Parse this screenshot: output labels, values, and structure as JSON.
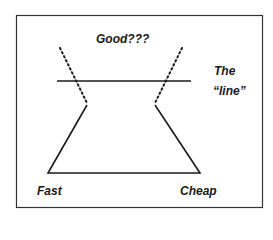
{
  "diagram": {
    "title": "",
    "labels": {
      "top": "Good???",
      "line_label_1": "The",
      "line_label_2": "“line”",
      "bottom_left": "Fast",
      "bottom_right": "Cheap"
    },
    "colors": {
      "stroke": "#1a1a1a",
      "border": "#333333",
      "background": "#ffffff"
    }
  }
}
